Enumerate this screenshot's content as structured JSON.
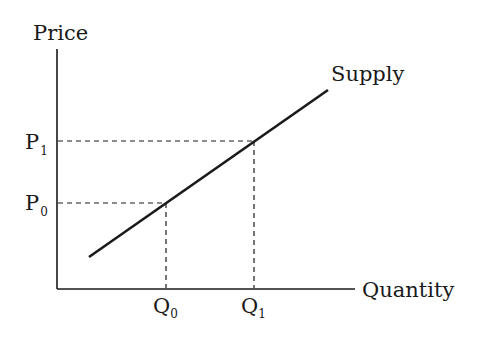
{
  "diagram": {
    "y_axis_label": "Price",
    "x_axis_label": "Quantity",
    "curve_label": "Supply",
    "price_levels": [
      {
        "label": "P",
        "subscript": "1"
      },
      {
        "label": "P",
        "subscript": "0"
      }
    ],
    "quantity_levels": [
      {
        "label": "Q",
        "subscript": "0"
      },
      {
        "label": "Q",
        "subscript": "1"
      }
    ],
    "colors": {
      "line": "#1a1a1a",
      "background": "#ffffff"
    }
  }
}
